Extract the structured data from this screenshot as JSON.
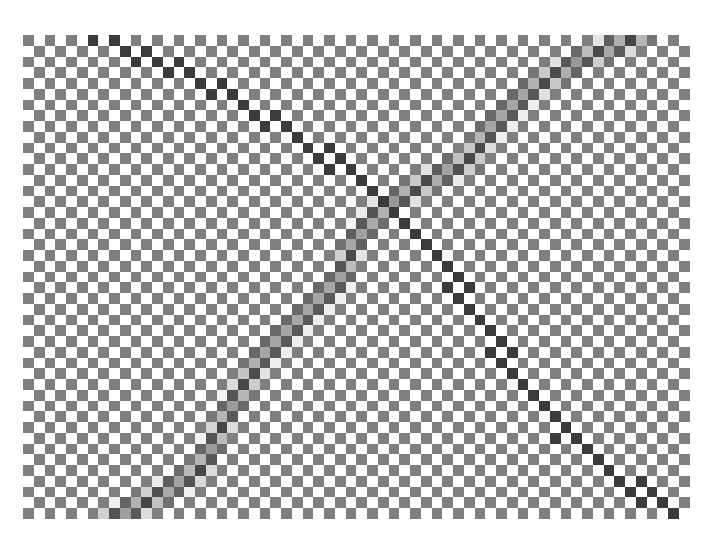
{
  "image": {
    "width": 713,
    "height": 550,
    "background": "#ffffff",
    "description": "Checkerboard pattern with two crossing dark diagonal paths"
  },
  "checkerboard": {
    "origin_x": 23,
    "origin_y": 35,
    "cell_size": 10.75,
    "cols": 62,
    "rows": 45,
    "light_color": "#ffffff",
    "dark_color": "#7f7f7f"
  },
  "paths": [
    {
      "name": "thin-line-top-left-to-bottom-right",
      "style": "thin",
      "color": "#333333",
      "width": 20,
      "affects": "dark-cells",
      "points": [
        [
          100,
          36
        ],
        [
          200,
          80
        ],
        [
          300,
          140
        ],
        [
          380,
          190
        ],
        [
          430,
          250
        ],
        [
          480,
          320
        ],
        [
          520,
          380
        ],
        [
          560,
          430
        ],
        [
          620,
          480
        ],
        [
          690,
          520
        ]
      ]
    },
    {
      "name": "thick-line-bottom-left-to-top-right",
      "style": "thick",
      "color": "#3a3a3a",
      "width": 28,
      "affects": "all-cells",
      "points": [
        [
          105,
          522
        ],
        [
          150,
          500
        ],
        [
          200,
          470
        ],
        [
          215,
          440
        ],
        [
          235,
          400
        ],
        [
          260,
          360
        ],
        [
          300,
          320
        ],
        [
          340,
          280
        ],
        [
          355,
          240
        ],
        [
          380,
          210
        ],
        [
          430,
          180
        ],
        [
          470,
          160
        ],
        [
          490,
          130
        ],
        [
          530,
          90
        ],
        [
          580,
          60
        ],
        [
          640,
          36
        ]
      ]
    }
  ]
}
